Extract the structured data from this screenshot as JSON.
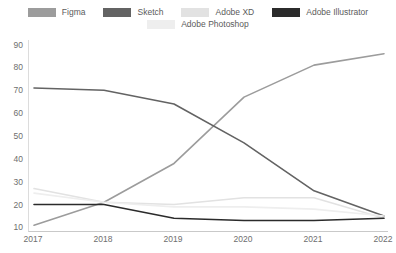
{
  "chart_data": {
    "type": "line",
    "title": "",
    "subtitle": "",
    "xlabel": "",
    "ylabel": "",
    "x": [
      "2017",
      "2018",
      "2019",
      "2020",
      "2021",
      "2022"
    ],
    "categories": [
      "2017",
      "2018",
      "2019",
      "2020",
      "2021",
      "2022"
    ],
    "ylim": [
      8,
      92
    ],
    "yticks": [
      10,
      20,
      30,
      40,
      50,
      60,
      70,
      80,
      90
    ],
    "grid": false,
    "legend_position": "top",
    "series": [
      {
        "name": "Figma",
        "color": "#9c9c9c",
        "values": [
          11,
          21,
          38,
          67,
          81,
          86
        ]
      },
      {
        "name": "Sketch",
        "color": "#636363",
        "values": [
          71,
          70,
          64,
          47,
          26,
          15
        ]
      },
      {
        "name": "Adobe XD",
        "color": "#e2e2e2",
        "values": [
          27,
          21,
          20,
          23,
          23,
          14
        ]
      },
      {
        "name": "Adobe Illustrator",
        "color": "#2b2b2b",
        "values": [
          20,
          20,
          14,
          13,
          13,
          14
        ]
      },
      {
        "name": "Adobe Photoshop",
        "color": "#eeeeee",
        "values": [
          25,
          21,
          19,
          19,
          18,
          15
        ]
      }
    ]
  },
  "legend": {
    "row1": [
      {
        "label": "Figma",
        "color": "#9c9c9c"
      },
      {
        "label": "Sketch",
        "color": "#636363"
      },
      {
        "label": "Adobe XD",
        "color": "#e2e2e2"
      },
      {
        "label": "Adobe Illustrator",
        "color": "#2b2b2b"
      }
    ],
    "row2": [
      {
        "label": "Adobe Photoshop",
        "color": "#eeeeee"
      }
    ]
  },
  "axes": {
    "y_ticks": [
      "90",
      "80",
      "70",
      "60",
      "50",
      "40",
      "30",
      "20",
      "10"
    ],
    "x_ticks": [
      "2017",
      "2018",
      "2019",
      "2020",
      "2021",
      "2022"
    ]
  },
  "colors": {
    "axis": "#c9c9c9",
    "tick_text": "#6e6e6e",
    "legend_text": "#5b5b5b",
    "background": "#ffffff"
  }
}
